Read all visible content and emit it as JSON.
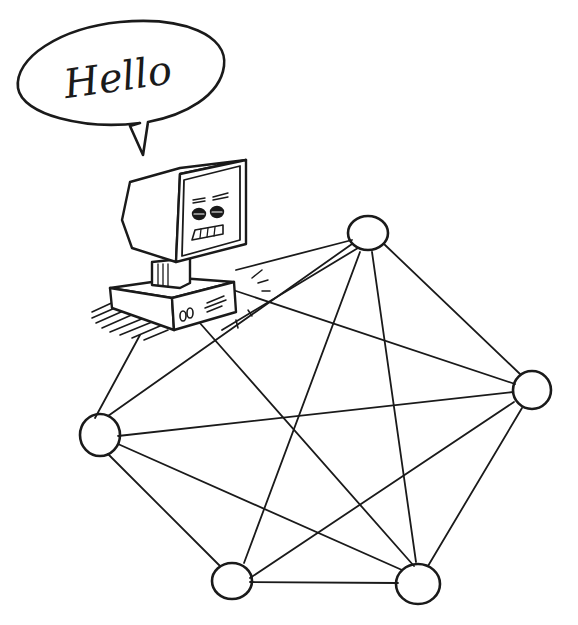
{
  "illustration": {
    "style": "hand-drawn pen sketch",
    "ink_color": "#1a1a1a",
    "background_color": "#ffffff"
  },
  "speech_bubble": {
    "text": "Hello"
  },
  "computer": {
    "label": "smiling computer terminal on desk"
  },
  "network": {
    "nodes": [
      {
        "id": "n1",
        "name": "top",
        "cx": 368,
        "cy": 233,
        "r": 19
      },
      {
        "id": "n2",
        "name": "right",
        "cx": 532,
        "cy": 390,
        "r": 19
      },
      {
        "id": "n3",
        "name": "left",
        "cx": 100,
        "cy": 435,
        "r": 20
      },
      {
        "id": "n4",
        "name": "bottom-left",
        "cx": 232,
        "cy": 581,
        "r": 19
      },
      {
        "id": "n5",
        "name": "bottom-right",
        "cx": 418,
        "cy": 583,
        "r": 21
      }
    ],
    "edges": [
      [
        "computer",
        "n3"
      ],
      [
        "computer",
        "n5"
      ],
      [
        "computer",
        "n2"
      ],
      [
        "computer",
        "n1"
      ],
      [
        "n3",
        "n1"
      ],
      [
        "n3",
        "n2"
      ],
      [
        "n3",
        "n4"
      ],
      [
        "n3",
        "n5"
      ],
      [
        "n1",
        "n2"
      ],
      [
        "n1",
        "n4"
      ],
      [
        "n1",
        "n5"
      ],
      [
        "n2",
        "n4"
      ],
      [
        "n2",
        "n5"
      ],
      [
        "n4",
        "n5"
      ]
    ]
  }
}
